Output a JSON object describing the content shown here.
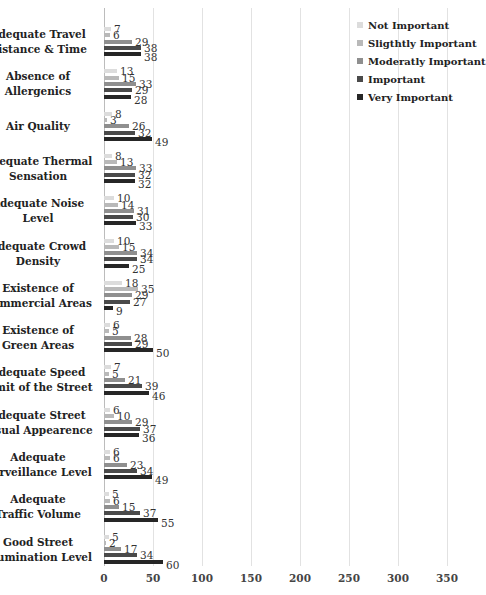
{
  "chart_data": {
    "type": "bar",
    "orientation": "horizontal",
    "title": "",
    "xlabel": "",
    "ylabel": "",
    "xlim": [
      0,
      350
    ],
    "x_ticks": [
      0,
      50,
      100,
      150,
      200,
      250,
      300,
      350
    ],
    "grid": true,
    "legend_position": "top-right",
    "categories": [
      "Adequate Travel Distance & Time",
      "Absence of Allergenics",
      "Air Quality",
      "Adequate Thermal Sensation",
      "Adequate Noise Level",
      "Adequate Crowd Density",
      "Existence of Commercial Areas",
      "Existence of Green Areas",
      "Adequate Speed Limit of the Street",
      "Adequate Street Visual Appearence",
      "Adequate Surveillance Level",
      "Adequate Traffic Volume",
      "Good Street Illumination Level"
    ],
    "category_label_lines": [
      [
        "Adequate Travel",
        "Distance & Time"
      ],
      [
        "Absence of",
        "Allergenics"
      ],
      [
        "Air Quality"
      ],
      [
        "Adequate Thermal",
        "Sensation"
      ],
      [
        "Adequate Noise",
        "Level"
      ],
      [
        "Adequate Crowd",
        "Density"
      ],
      [
        "Existence of",
        "Commercial Areas"
      ],
      [
        "Existence of",
        "Green Areas"
      ],
      [
        "Adequate Speed",
        "Limit of the Street"
      ],
      [
        "Adequate Street",
        "Visual Appearence"
      ],
      [
        "Adequate",
        "Surveillance Level"
      ],
      [
        "Adequate",
        "Traffic Volume"
      ],
      [
        "Good Street",
        "Illumination Level"
      ]
    ],
    "series": [
      {
        "name": "Not Important",
        "color": "#dcdcdc",
        "values": [
          7,
          13,
          8,
          8,
          10,
          10,
          18,
          6,
          7,
          6,
          6,
          5,
          5
        ]
      },
      {
        "name": "Sligthtly Important",
        "color": "#b9b9b9",
        "values": [
          6,
          15,
          3,
          13,
          14,
          15,
          35,
          5,
          5,
          10,
          6,
          6,
          2
        ]
      },
      {
        "name": "Moderatly Important",
        "color": "#8f8f8f",
        "values": [
          29,
          33,
          26,
          33,
          31,
          34,
          29,
          28,
          21,
          29,
          23,
          15,
          17
        ]
      },
      {
        "name": "Important",
        "color": "#4a4a4a",
        "values": [
          38,
          29,
          32,
          32,
          30,
          34,
          27,
          29,
          39,
          37,
          34,
          37,
          34
        ]
      },
      {
        "name": "Very Important",
        "color": "#262626",
        "values": [
          38,
          28,
          49,
          32,
          33,
          25,
          9,
          50,
          46,
          36,
          49,
          55,
          60
        ]
      }
    ]
  }
}
